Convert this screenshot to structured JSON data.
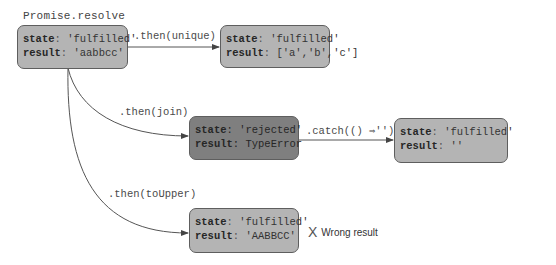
{
  "diagram": {
    "origin_label": "Promise.resolve",
    "nodes": [
      {
        "id": "initial",
        "state_key": "state",
        "state_value": "'fulfilled'",
        "result_key": "result",
        "result_value": "'aabbcc'",
        "status": "fulfilled"
      },
      {
        "id": "unique",
        "state_key": "state",
        "state_value": "'fulfilled'",
        "result_key": "result",
        "result_value": "['a','b','c']",
        "status": "fulfilled"
      },
      {
        "id": "join",
        "state_key": "state",
        "state_value": "'rejected'",
        "result_key": "result",
        "result_value": "TypeError",
        "status": "rejected"
      },
      {
        "id": "catch",
        "state_key": "state",
        "state_value": "'fulfilled'",
        "result_key": "result",
        "result_value": "''",
        "status": "fulfilled"
      },
      {
        "id": "toUpper",
        "state_key": "state",
        "state_value": "'fulfilled'",
        "result_key": "result",
        "result_value": "'AABBCC'",
        "status": "fulfilled"
      }
    ],
    "edges": [
      {
        "from": "initial",
        "to": "unique",
        "label": ".then(unique)"
      },
      {
        "from": "initial",
        "to": "join",
        "label": ".then(join)"
      },
      {
        "from": "join",
        "to": "catch",
        "label": ".catch(() ⇒'')"
      },
      {
        "from": "initial",
        "to": "toUpper",
        "label": ".then(toUpper)"
      }
    ],
    "annotation": {
      "icon": "x-mark-icon",
      "glyph": "X",
      "text": "Wrong result"
    },
    "colors": {
      "fulfilled_fill": "#b4b4b4",
      "rejected_fill": "#7f7f7f",
      "border": "#5e5e5e",
      "edge": "#555555"
    }
  }
}
